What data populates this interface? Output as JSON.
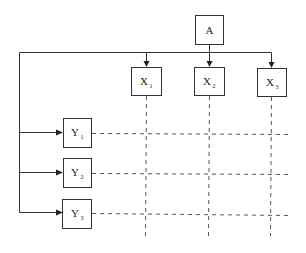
{
  "diagram": {
    "root": {
      "label": "A"
    },
    "columns": [
      {
        "label": "X",
        "subscript": "1"
      },
      {
        "label": "X",
        "subscript": "2"
      },
      {
        "label": "X",
        "subscript": "3"
      }
    ],
    "rows": [
      {
        "label": "Y",
        "subscript": "1"
      },
      {
        "label": "Y",
        "subscript": "2"
      },
      {
        "label": "Y",
        "subscript": "3"
      }
    ]
  }
}
